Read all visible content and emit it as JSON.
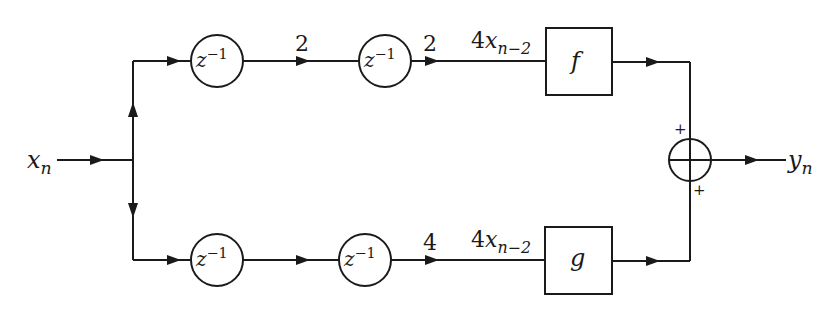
{
  "diagram": {
    "input": {
      "var": "x",
      "sub": "n"
    },
    "output": {
      "var": "y",
      "sub": "n"
    },
    "top_branch": {
      "delays": [
        {
          "base": "z",
          "exp": "−1"
        },
        {
          "base": "z",
          "exp": "−1"
        }
      ],
      "edge_labels": [
        "2",
        "2"
      ],
      "pre_block_label": {
        "coef": "4",
        "var": "x",
        "sub": "n−2"
      },
      "block": "f",
      "sum_sign": "+"
    },
    "bottom_branch": {
      "delays": [
        {
          "base": "z",
          "exp": "−1"
        },
        {
          "base": "z",
          "exp": "−1"
        }
      ],
      "edge_labels": [
        "4"
      ],
      "pre_block_label": {
        "coef": "4",
        "var": "x",
        "sub": "n−2"
      },
      "block": "g",
      "sum_sign": "+"
    },
    "summer": {
      "symbol": "⊕"
    },
    "colors": {
      "stroke": "#1a1a1a",
      "background": "#ffffff"
    }
  }
}
